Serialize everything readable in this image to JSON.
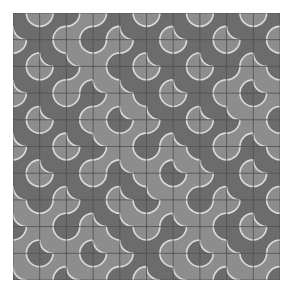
{
  "pattern": {
    "name": "truchet-tiles",
    "rows": 10,
    "cols": 10,
    "cell_size": 26.7,
    "colors": {
      "light": "#8d8d8d",
      "dark": "#6c6c6c",
      "arc": "#dcdcdc",
      "grid": "#4e4e4e",
      "background": "#ffffff"
    },
    "tiles": [
      "/\\\\\\/\\/\\/\\",
      "\\//\\\\/\\/\\/",
      "/\\\\//\\/\\\\/",
      "\\/\\\\//\\//\\",
      "/\\//\\\\/\\\\/",
      "\\/\\\\/\\//\\/",
      "/\\/\\//\\\\/\\",
      "/\\\\//\\/\\\\/",
      "\\/\\//\\\\//\\",
      "/\\/\\\\//\\/\\"
    ]
  }
}
